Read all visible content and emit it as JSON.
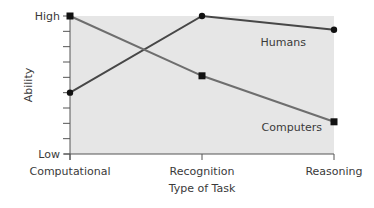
{
  "chart_data": {
    "type": "line",
    "title": "",
    "xlabel": "Type of Task",
    "ylabel": "Ability",
    "categories": [
      "Computational",
      "Recognition",
      "Reasoning"
    ],
    "y_tick_labels": {
      "low": "Low",
      "high": "High"
    },
    "ylim": [
      0,
      9
    ],
    "y_minor_ticks": 10,
    "grid": false,
    "series": [
      {
        "name": "Humans",
        "values": [
          4,
          9,
          8.1
        ],
        "marker": "circle",
        "color": "#474747"
      },
      {
        "name": "Computers",
        "values": [
          9,
          5.1,
          2.1
        ],
        "marker": "square",
        "color": "#6e6e6e"
      }
    ],
    "annotations": [
      {
        "text": "Humans",
        "near": "Humans series at Reasoning, below"
      },
      {
        "text": "Computers",
        "near": "Computers series at Reasoning, left"
      }
    ],
    "plot_background": "#e6e6e6",
    "legend": "none (inline series labels)"
  }
}
